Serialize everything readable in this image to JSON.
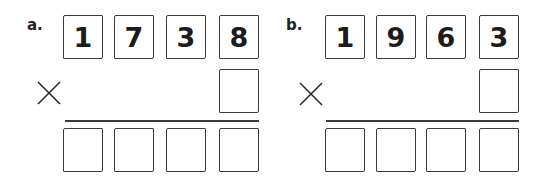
{
  "problems": [
    {
      "label": "a.",
      "multiplicand_digits": [
        "1",
        "7",
        "3",
        "8"
      ],
      "multiplier_digit": "",
      "operator": "×",
      "answer_digits": [
        "",
        "",
        "",
        ""
      ]
    },
    {
      "label": "b.",
      "multiplicand_digits": [
        "1",
        "9",
        "6",
        "3"
      ],
      "multiplier_digit": "",
      "operator": "×",
      "answer_digits": [
        "",
        "",
        "",
        ""
      ]
    }
  ]
}
